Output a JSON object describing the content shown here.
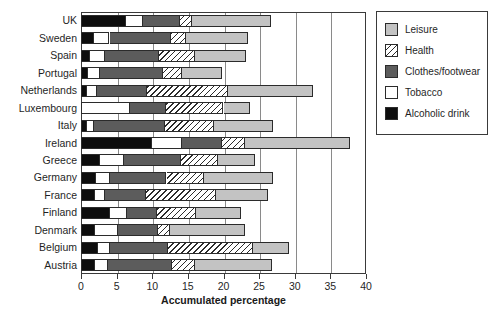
{
  "chart_data": {
    "type": "bar",
    "orientation": "horizontal",
    "stacked": true,
    "title": "",
    "xlabel": "Accumulated percentage",
    "ylabel": "",
    "xlim": [
      0,
      40
    ],
    "xticks": [
      0,
      5,
      10,
      15,
      20,
      25,
      30,
      35,
      40
    ],
    "grid": true,
    "grid_axis": "x",
    "legend_position": "right",
    "categories": [
      "UK",
      "Sweden",
      "Spain",
      "Portugal",
      "Netherlands",
      "Luxembourg",
      "Italy",
      "Ireland",
      "Greece",
      "Germany",
      "France",
      "Finland",
      "Denmark",
      "Belgium",
      "Austria"
    ],
    "series": [
      {
        "name": "Alcoholic drink",
        "color": "#0d0d0d",
        "pattern": "solid",
        "values": [
          6.3,
          1.8,
          1.3,
          1.0,
          0.8,
          0.2,
          0.8,
          10.0,
          2.7,
          2.1,
          2.0,
          4.1,
          2.0,
          2.4,
          2.0
        ]
      },
      {
        "name": "Tobacco",
        "color": "#ffffff",
        "pattern": "solid",
        "values": [
          2.4,
          2.2,
          2.0,
          1.7,
          1.4,
          6.7,
          1.0,
          4.2,
          3.3,
          2.0,
          1.3,
          2.4,
          3.2,
          1.7,
          1.8
        ]
      },
      {
        "name": "Clothes/footwear",
        "color": "#5c5c5c",
        "pattern": "solid",
        "values": [
          5.2,
          8.7,
          7.6,
          8.8,
          7.0,
          5.0,
          10.0,
          5.6,
          8.1,
          7.9,
          5.8,
          4.1,
          5.6,
          8.1,
          9.0
        ]
      },
      {
        "name": "Health",
        "color": "#ffffff",
        "pattern": "diagonal-hatch",
        "values": [
          1.7,
          2.1,
          5.1,
          2.7,
          11.4,
          8.1,
          6.9,
          3.2,
          5.1,
          5.3,
          9.8,
          5.6,
          1.7,
          11.9,
          3.2
        ]
      },
      {
        "name": "Leisure",
        "color": "#c3c3c3",
        "pattern": "solid",
        "values": [
          11.0,
          8.6,
          7.2,
          5.6,
          11.9,
          3.7,
          8.3,
          14.7,
          5.2,
          9.7,
          7.4,
          6.2,
          10.5,
          5.1,
          10.8
        ]
      }
    ],
    "totals": [
      26.6,
      23.4,
      23.2,
      19.8,
      32.5,
      23.7,
      27.0,
      37.7,
      24.4,
      27.0,
      26.3,
      22.4,
      23.0,
      29.2,
      26.8
    ]
  },
  "legend": {
    "items": [
      {
        "label": "Leisure",
        "swatch": "solid-light-gray"
      },
      {
        "label": "Health",
        "swatch": "diagonal-hatch"
      },
      {
        "label": "Clothes/footwear",
        "swatch": "solid-dark-gray"
      },
      {
        "label": "Tobacco",
        "swatch": "solid-white"
      },
      {
        "label": "Alcoholic drink",
        "swatch": "solid-black"
      }
    ]
  },
  "axis": {
    "x_title": "Accumulated percentage",
    "x_tick_labels": [
      "0",
      "5",
      "10",
      "15",
      "20",
      "25",
      "30",
      "35",
      "40"
    ]
  },
  "colors": {
    "alcoholic_drink": "#0d0d0d",
    "tobacco": "#ffffff",
    "clothes_footwear": "#5c5c5c",
    "health": "#ffffff",
    "leisure": "#c3c3c3",
    "outline": "#2b2b2b",
    "gridline": "#8a8a8a",
    "background": "#ffffff"
  }
}
